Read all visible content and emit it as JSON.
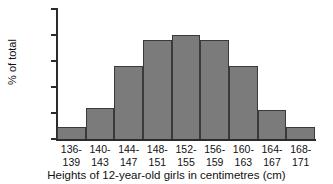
{
  "chart_data": {
    "type": "bar",
    "title": "",
    "subtitle": "",
    "xlabel": "Heights of 12-year-old girls in centimetres (cm)",
    "ylabel": "% of total",
    "categories": [
      "136-\n139",
      "140-\n143",
      "144-\n147",
      "148-\n151",
      "152-\n155",
      "156-\n159",
      "160-\n163",
      "164-\n167",
      "168-\n171"
    ],
    "bin_labels_line1": [
      "136-",
      "140-",
      "144-",
      "148-",
      "152-",
      "156-",
      "160-",
      "164-",
      "168-"
    ],
    "bin_labels_line2": [
      "139",
      "143",
      "147",
      "151",
      "155",
      "159",
      "163",
      "167",
      "171"
    ],
    "values": [
      2.4,
      6.0,
      14.0,
      19.0,
      20.0,
      19.0,
      14.0,
      5.6,
      2.3
    ],
    "ylim": [
      0,
      25
    ],
    "yticks": [
      0,
      5,
      10,
      15,
      20,
      25
    ],
    "ytick_labels": [
      "0",
      "5",
      "10",
      "15",
      "20",
      "25"
    ],
    "grid": false,
    "legend": false,
    "legend_position": "none",
    "bar_fill_color": "#7b7b7b",
    "bar_edge_color": "#3a3a3a",
    "axis_color": "#2b2b2b",
    "background_color": "#ffffff"
  }
}
